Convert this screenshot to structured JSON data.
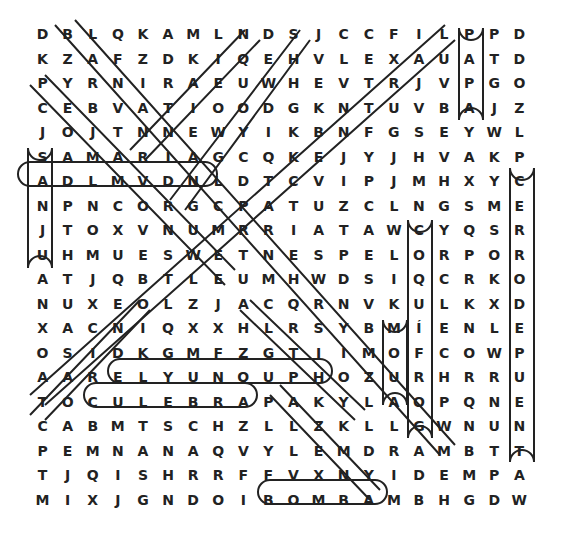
{
  "puzzle": {
    "rows": [
      [
        "D",
        "B",
        "L",
        "Q",
        "K",
        "A",
        "M",
        "L",
        "N",
        "D",
        "S",
        "J",
        "C",
        "C",
        "F",
        "I",
        "L",
        "P",
        "P",
        "D"
      ],
      [
        "K",
        "Z",
        "A",
        "F",
        "Z",
        "D",
        "K",
        "I",
        "Q",
        "E",
        "H",
        "V",
        "L",
        "E",
        "X",
        "A",
        "U",
        "A",
        "T",
        "D"
      ],
      [
        "P",
        "Y",
        "R",
        "N",
        "I",
        "R",
        "A",
        "E",
        "U",
        "W",
        "H",
        "E",
        "V",
        "T",
        "R",
        "J",
        "V",
        "P",
        "G",
        "O"
      ],
      [
        "C",
        "E",
        "B",
        "V",
        "A",
        "T",
        "I",
        "O",
        "O",
        "D",
        "G",
        "K",
        "N",
        "T",
        "U",
        "V",
        "B",
        "A",
        "J",
        "Z"
      ],
      [
        "J",
        "O",
        "J",
        "T",
        "N",
        "N",
        "E",
        "W",
        "Y",
        "I",
        "K",
        "B",
        "N",
        "F",
        "G",
        "S",
        "E",
        "Y",
        "W",
        "L"
      ],
      [
        "S",
        "A",
        "M",
        "A",
        "R",
        "I",
        "A",
        "G",
        "C",
        "Q",
        "K",
        "E",
        "J",
        "Y",
        "J",
        "H",
        "V",
        "A",
        "K",
        "P"
      ],
      [
        "A",
        "D",
        "L",
        "M",
        "V",
        "D",
        "N",
        "L",
        "D",
        "T",
        "C",
        "V",
        "I",
        "P",
        "J",
        "M",
        "H",
        "X",
        "Y",
        "C"
      ],
      [
        "N",
        "P",
        "N",
        "C",
        "O",
        "R",
        "G",
        "C",
        "P",
        "A",
        "T",
        "U",
        "Z",
        "C",
        "L",
        "N",
        "G",
        "S",
        "M",
        "E"
      ],
      [
        "J",
        "T",
        "O",
        "X",
        "V",
        "N",
        "U",
        "M",
        "R",
        "R",
        "I",
        "A",
        "T",
        "A",
        "W",
        "C",
        "Y",
        "Q",
        "S",
        "R"
      ],
      [
        "U",
        "H",
        "M",
        "U",
        "E",
        "S",
        "W",
        "E",
        "T",
        "N",
        "E",
        "S",
        "P",
        "E",
        "L",
        "O",
        "R",
        "P",
        "O",
        "R"
      ],
      [
        "A",
        "T",
        "J",
        "Q",
        "B",
        "T",
        "L",
        "E",
        "U",
        "M",
        "H",
        "W",
        "D",
        "S",
        "I",
        "Q",
        "C",
        "R",
        "K",
        "O"
      ],
      [
        "N",
        "U",
        "X",
        "E",
        "O",
        "L",
        "Z",
        "J",
        "A",
        "C",
        "Q",
        "R",
        "N",
        "V",
        "K",
        "U",
        "L",
        "K",
        "X",
        "D"
      ],
      [
        "X",
        "A",
        "C",
        "N",
        "I",
        "Q",
        "X",
        "X",
        "H",
        "L",
        "R",
        "S",
        "Y",
        "B",
        "M",
        "Í",
        "E",
        "N",
        "L",
        "E"
      ],
      [
        "O",
        "S",
        "I",
        "D",
        "K",
        "G",
        "M",
        "F",
        "Z",
        "G",
        "T",
        "I",
        "I",
        "M",
        "O",
        "F",
        "C",
        "O",
        "W",
        "P"
      ],
      [
        "A",
        "A",
        "R",
        "E",
        "L",
        "Y",
        "U",
        "N",
        "Q",
        "U",
        "P",
        "H",
        "O",
        "Z",
        "U",
        "R",
        "H",
        "R",
        "R",
        "U"
      ],
      [
        "T",
        "O",
        "C",
        "U",
        "L",
        "E",
        "B",
        "R",
        "A",
        "P",
        "A",
        "K",
        "Y",
        "L",
        "A",
        "O",
        "P",
        "Q",
        "N",
        "E"
      ],
      [
        "C",
        "A",
        "B",
        "M",
        "T",
        "S",
        "C",
        "H",
        "Z",
        "L",
        "L",
        "Z",
        "K",
        "L",
        "L",
        "G",
        "W",
        "N",
        "U",
        "N"
      ],
      [
        "P",
        "E",
        "M",
        "N",
        "A",
        "N",
        "A",
        "Q",
        "V",
        "Y",
        "L",
        "E",
        "M",
        "D",
        "R",
        "A",
        "M",
        "B",
        "T",
        "T"
      ],
      [
        "T",
        "J",
        "Q",
        "I",
        "S",
        "H",
        "R",
        "R",
        "F",
        "F",
        "V",
        "X",
        "N",
        "Y",
        "I",
        "D",
        "E",
        "M",
        "P",
        "A"
      ],
      [
        "M",
        "I",
        "X",
        "J",
        "G",
        "N",
        "D",
        "O",
        "I",
        "B",
        "O",
        "M",
        "B",
        "A",
        "M",
        "B",
        "H",
        "G",
        "D",
        "W"
      ]
    ],
    "found_words": [
      "BOMBA",
      "CULEBRA",
      "ELYUNQUE",
      "MOFONGO",
      "CERRO DE PUENTA",
      "PAPAYA",
      "SAN JUAN",
      "CONQUISTADOR",
      "SAMARIA"
    ]
  }
}
